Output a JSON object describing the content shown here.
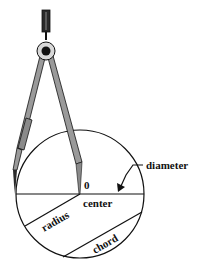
{
  "diagram": {
    "labels": {
      "center_mark": "0",
      "center": "center",
      "diameter": "diameter",
      "radius": "radius",
      "chord": "chord"
    },
    "colors": {
      "ink": "#111111",
      "compass_fill": "#9a9a9a",
      "compass_dark": "#2a2a2a",
      "background": "#ffffff"
    }
  }
}
